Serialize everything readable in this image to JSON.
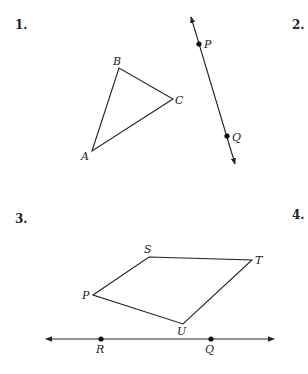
{
  "problems": [
    {
      "number": "1.",
      "x": 15,
      "y": 19
    },
    {
      "number": "2.",
      "x": 292,
      "y": 19
    },
    {
      "number": "3.",
      "x": 15,
      "y": 213
    },
    {
      "number": "4.",
      "x": 292,
      "y": 209
    }
  ],
  "colors": {
    "stroke": "#222222",
    "background": "#ffffff"
  },
  "triangle": {
    "name": "triangle ABC",
    "vertices": [
      {
        "label": "A",
        "x": 92,
        "y": 151,
        "lx": 81,
        "ly": 160
      },
      {
        "label": "B",
        "x": 119,
        "y": 68,
        "lx": 113,
        "ly": 65
      },
      {
        "label": "C",
        "x": 173,
        "y": 99,
        "lx": 175,
        "ly": 104
      }
    ]
  },
  "line_PQ": {
    "name": "line PQ",
    "start": {
      "x": 191,
      "y": 17
    },
    "end": {
      "x": 235,
      "y": 164
    },
    "points": [
      {
        "label": "P",
        "x": 199,
        "y": 44,
        "lx": 204,
        "ly": 48
      },
      {
        "label": "Q",
        "x": 227,
        "y": 136,
        "lx": 232,
        "ly": 141
      }
    ]
  },
  "quadrilateral": {
    "name": "quadrilateral PSTU",
    "vertices": [
      {
        "label": "P",
        "x": 93,
        "y": 295,
        "lx": 82,
        "ly": 299
      },
      {
        "label": "S",
        "x": 149,
        "y": 257,
        "lx": 144,
        "ly": 253
      },
      {
        "label": "T",
        "x": 252,
        "y": 260,
        "lx": 255,
        "ly": 264
      },
      {
        "label": "U",
        "x": 183,
        "y": 324,
        "lx": 177,
        "ly": 335
      }
    ]
  },
  "line_RQ": {
    "name": "line RQ",
    "start": {
      "x": 46,
      "y": 339
    },
    "end": {
      "x": 274,
      "y": 339
    },
    "points": [
      {
        "label": "R",
        "x": 101,
        "y": 339,
        "lx": 96,
        "ly": 353
      },
      {
        "label": "Q",
        "x": 211,
        "y": 339,
        "lx": 205,
        "ly": 353
      }
    ]
  }
}
